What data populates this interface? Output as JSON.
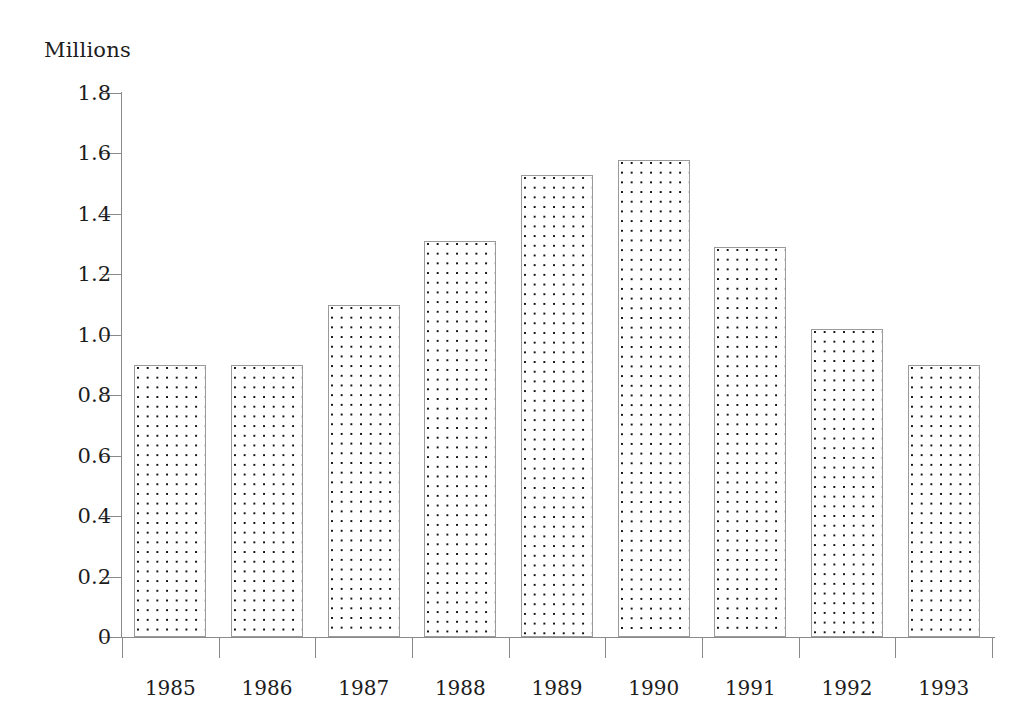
{
  "chart_data": {
    "type": "bar",
    "title": "",
    "subtitle": "",
    "xlabel": "",
    "ylabel": "Millions",
    "categories": [
      "1985",
      "1986",
      "1987",
      "1988",
      "1989",
      "1990",
      "1991",
      "1992",
      "1993"
    ],
    "values": [
      0.9,
      0.9,
      1.1,
      1.31,
      1.53,
      1.58,
      1.29,
      1.02,
      0.9
    ],
    "ylim": [
      0,
      1.8
    ],
    "ytick_labels": [
      "0",
      "0.2",
      "0.4",
      "0.6",
      "0.8",
      "1.0",
      "1.2",
      "1.4",
      "1.6",
      "1.8"
    ],
    "ytick_values": [
      0,
      0.2,
      0.4,
      0.6,
      0.8,
      1.0,
      1.2,
      1.4,
      1.6,
      1.8
    ],
    "grid": false,
    "legend": null,
    "legend_position": "none",
    "bar_fill": "dotted-stipple",
    "bar_border_color": "#9a9a9a",
    "axis_color": "#8a8a8a",
    "text_color": "#1d1d1d",
    "background": "#ffffff"
  }
}
